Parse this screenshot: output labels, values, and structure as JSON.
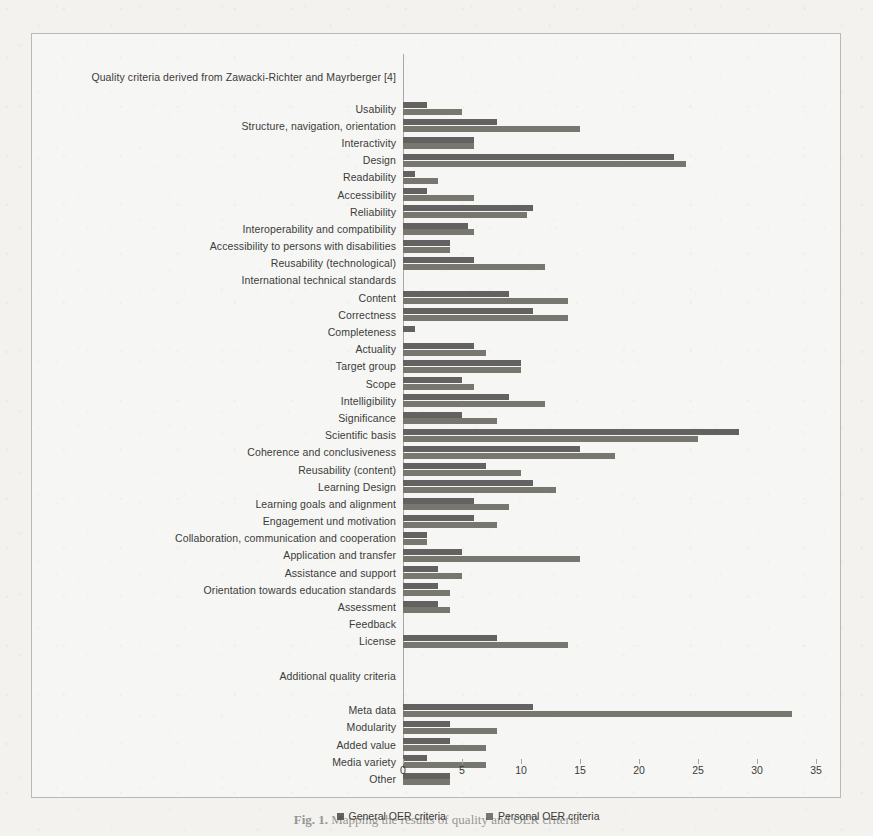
{
  "figure": {
    "caption_label": "Fig. 1.",
    "caption_text": "Mapping the results of quality and OER criteria"
  },
  "legend": {
    "general_label": "General OER criteria",
    "personal_label": "Personal OER criteria",
    "general_color": "#636260",
    "personal_color": "#77766f"
  },
  "axis": {
    "ticks": [
      "0",
      "5",
      "10",
      "15",
      "20",
      "25",
      "30",
      "35"
    ],
    "min": 0,
    "max": 35,
    "step": 5
  },
  "sections": {
    "primary_header": "Quality criteria derived from Zawacki-Richter and Mayrberger [4]",
    "secondary_header": "Additional quality criteria"
  },
  "chart_data": {
    "type": "bar",
    "orientation": "horizontal",
    "title": "",
    "xlabel": "",
    "ylabel": "",
    "xlim": [
      0,
      35
    ],
    "grid": true,
    "legend_position": "bottom",
    "categories": [
      "Quality criteria derived from Zawacki-Richter and Mayrberger [4]",
      "Usability",
      "Structure, navigation, orientation",
      "Interactivity",
      "Design",
      "Readability",
      "Accessibility",
      "Reliability",
      "Interoperability and compatibility",
      "Accessibility to persons with disabilities",
      "Reusability (technological)",
      "International technical standards",
      "Content",
      "Correctness",
      "Completeness",
      "Actuality",
      "Target group",
      "Scope",
      "Intelligibility",
      "Significance",
      "Scientific basis",
      "Coherence and conclusiveness",
      "Reusability (content)",
      "Learning Design",
      "Learning goals and alignment",
      "Engagement und motivation",
      "Collaboration, communication and cooperation",
      "Application and transfer",
      "Assistance and support",
      "Orientation towards education standards",
      "Assessment",
      "Feedback",
      "License",
      "",
      "Additional quality criteria",
      "",
      "Meta data",
      "Modularity",
      "Added value",
      "Media variety",
      "Other"
    ],
    "series": [
      {
        "name": "General OER criteria",
        "values": [
          null,
          2,
          8,
          6,
          23,
          1,
          2,
          11,
          5.5,
          4,
          6,
          0,
          9,
          11,
          1,
          6,
          10,
          5,
          9,
          5,
          28.5,
          15,
          7,
          11,
          6,
          6,
          2,
          5,
          3,
          3,
          3,
          0,
          8,
          null,
          null,
          null,
          11,
          4,
          4,
          2,
          4
        ]
      },
      {
        "name": "Personal OER criteria",
        "values": [
          null,
          5,
          15,
          6,
          24,
          3,
          6,
          10.5,
          6,
          4,
          12,
          0,
          14,
          14,
          0,
          7,
          10,
          6,
          12,
          8,
          25,
          18,
          10,
          13,
          9,
          8,
          2,
          15,
          5,
          4,
          4,
          0,
          14,
          null,
          null,
          null,
          33,
          8,
          7,
          7,
          4
        ]
      }
    ]
  }
}
